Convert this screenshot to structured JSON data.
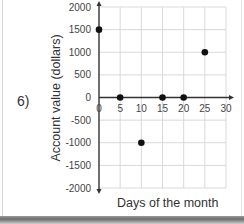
{
  "problem": {
    "label": "6)"
  },
  "chart_data": {
    "type": "scatter",
    "title": "",
    "xlabel": "Days of the month",
    "ylabel": "Account value (dollars)",
    "x": [
      0,
      5,
      10,
      15,
      20,
      25
    ],
    "y": [
      1500,
      0,
      -1000,
      0,
      0,
      1000
    ],
    "series": [
      {
        "name": "Account value",
        "points": [
          [
            0,
            1500
          ],
          [
            5,
            0
          ],
          [
            10,
            -1000
          ],
          [
            15,
            0
          ],
          [
            20,
            0
          ],
          [
            25,
            1000
          ]
        ]
      }
    ],
    "xlim": [
      0,
      30
    ],
    "ylim": [
      -2000,
      2000
    ],
    "xticks": [
      "0",
      "5",
      "10",
      "15",
      "20",
      "25",
      "30"
    ],
    "yticks": [
      "2000",
      "1500",
      "1000",
      "500",
      "0",
      "-500",
      "-1000",
      "-1500",
      "-2000"
    ],
    "grid": true,
    "legend": null,
    "marker_color": "#111111",
    "grid_color": "#d9d9d9",
    "axis_color": "#333333"
  }
}
